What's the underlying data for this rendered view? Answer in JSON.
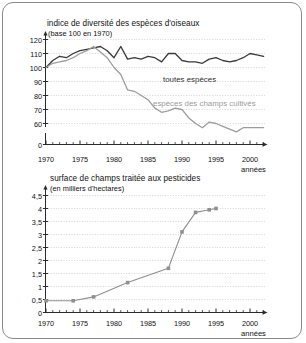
{
  "figure": {
    "panels": [
      {
        "id": "birds",
        "title": "indice de diversité des espèces d'oiseaux",
        "subtitle": "(base 100 en 1970)",
        "xaxis_name": "années",
        "series_label_all": "toutes espèces",
        "series_label_farm": "espèces des champs cultivés"
      },
      {
        "id": "pesticides",
        "title": "surface de champs traitée aux pesticides",
        "subtitle": "(en milliers d'hectares)",
        "xaxis_name": "années"
      }
    ]
  },
  "chart_data": [
    {
      "type": "line",
      "id": "birds",
      "title": "indice de diversité des espèces d'oiseaux",
      "subtitle": "(base 100 en 1970)",
      "xlabel": "années",
      "ylabel": "",
      "xlim": [
        1970,
        2003
      ],
      "ylim": [
        55,
        123
      ],
      "yticks": [
        0,
        60,
        70,
        80,
        90,
        100,
        110,
        120
      ],
      "ytick_labels": [
        "0",
        "60",
        "70",
        "80",
        "90",
        "100",
        "110",
        "120"
      ],
      "y_axis_broken_below": 60,
      "xticks": [
        1970,
        1975,
        1980,
        1985,
        1990,
        1995,
        2000
      ],
      "xtick_labels": [
        "1970",
        "1975",
        "1980",
        "1985",
        "1990",
        "1995",
        "2000"
      ],
      "minor_xticks_every": 1,
      "grid": "horizontal-dotted",
      "legend": "inline-annotations",
      "colors": {
        "toutes_especes": "#3a3a3a",
        "champs_cultives": "#9d9d9d"
      },
      "x": [
        1970,
        1971,
        1972,
        1973,
        1974,
        1975,
        1976,
        1977,
        1978,
        1979,
        1980,
        1981,
        1982,
        1983,
        1984,
        1985,
        1986,
        1987,
        1988,
        1989,
        1990,
        1991,
        1992,
        1993,
        1994,
        1995,
        1996,
        1997,
        1998,
        1999,
        2000,
        2001,
        2002
      ],
      "series": [
        {
          "name": "toutes espèces",
          "color": "#3a3a3a",
          "values": [
            100,
            105,
            108,
            107,
            110,
            112,
            113,
            114,
            115,
            112,
            107,
            115,
            106,
            107,
            106,
            108,
            107,
            104,
            110,
            110,
            105,
            104,
            104,
            103,
            106,
            107,
            105,
            104,
            105,
            107,
            110,
            109,
            108
          ]
        },
        {
          "name": "espèces des champs cultivés",
          "color": "#9d9d9d",
          "values": [
            100,
            103,
            104,
            105,
            107,
            110,
            112,
            115,
            111,
            107,
            100,
            95,
            84,
            83,
            80,
            77,
            71,
            68,
            69,
            71,
            70,
            64,
            60,
            57,
            61,
            60,
            58,
            56,
            54,
            57,
            57,
            57,
            57
          ]
        }
      ]
    },
    {
      "type": "line",
      "id": "pesticides",
      "title": "surface de champs traitée aux pesticides",
      "subtitle": "(en milliers d'hectares)",
      "xlabel": "années",
      "ylabel": "",
      "xlim": [
        1970,
        2003
      ],
      "ylim": [
        0,
        4.7
      ],
      "yticks": [
        0,
        0.5,
        1,
        1.5,
        2,
        2.5,
        3,
        3.5,
        4,
        4.5
      ],
      "ytick_labels": [
        "0",
        "0,5",
        "1",
        "1,5",
        "2",
        "2,5",
        "3",
        "3,5",
        "4",
        "4,5"
      ],
      "xticks": [
        1970,
        1975,
        1980,
        1985,
        1990,
        1995,
        2000
      ],
      "xtick_labels": [
        "1970",
        "1975",
        "1980",
        "1985",
        "1990",
        "1995",
        "2000"
      ],
      "minor_xticks_every": 1,
      "grid": "horizontal-dotted",
      "markers": "square",
      "color": "#8f8f8f",
      "x": [
        1970,
        1974,
        1977,
        1982,
        1988,
        1990,
        1992,
        1994,
        1995
      ],
      "values": [
        0.45,
        0.45,
        0.6,
        1.15,
        1.7,
        3.1,
        3.85,
        3.95,
        4.0
      ]
    }
  ]
}
